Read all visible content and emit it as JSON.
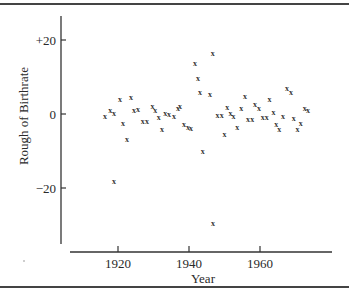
{
  "chart_data": {
    "type": "scatter",
    "title": "",
    "xlabel": "Year",
    "ylabel": "Rough of Birthrate",
    "marker": "x",
    "xlim": [
      1906,
      1980
    ],
    "ylim": [
      -35,
      27
    ],
    "grid": false,
    "legend": null,
    "x_ticks": [
      1920,
      1940,
      1960
    ],
    "x_tick_labels": [
      "1920",
      "1940",
      "1960"
    ],
    "y_ticks": [
      20,
      0,
      -20
    ],
    "y_tick_labels": [
      "+20",
      "0",
      "−20"
    ],
    "points": [
      {
        "x": 1916.3,
        "y": -0.5
      },
      {
        "x": 1917.8,
        "y": 1.0
      },
      {
        "x": 1918.9,
        "y": 0.3
      },
      {
        "x": 1918.9,
        "y": -18.0
      },
      {
        "x": 1920.6,
        "y": 4.0
      },
      {
        "x": 1921.4,
        "y": -2.5
      },
      {
        "x": 1922.5,
        "y": -6.8
      },
      {
        "x": 1923.7,
        "y": 4.5
      },
      {
        "x": 1924.5,
        "y": 1.2
      },
      {
        "x": 1925.6,
        "y": 1.4
      },
      {
        "x": 1927.0,
        "y": -2.0
      },
      {
        "x": 1928.2,
        "y": -2.0
      },
      {
        "x": 1929.7,
        "y": 2.2
      },
      {
        "x": 1930.5,
        "y": 1.1
      },
      {
        "x": 1931.5,
        "y": -0.8
      },
      {
        "x": 1932.4,
        "y": -4.0
      },
      {
        "x": 1933.3,
        "y": 0.3
      },
      {
        "x": 1934.4,
        "y": 0.0
      },
      {
        "x": 1935.8,
        "y": -0.5
      },
      {
        "x": 1936.9,
        "y": 1.6
      },
      {
        "x": 1937.5,
        "y": 2.2
      },
      {
        "x": 1938.6,
        "y": -2.7
      },
      {
        "x": 1939.7,
        "y": -3.5
      },
      {
        "x": 1940.6,
        "y": -3.8
      },
      {
        "x": 1941.7,
        "y": 13.8
      },
      {
        "x": 1942.5,
        "y": 9.7
      },
      {
        "x": 1943.1,
        "y": 5.9
      },
      {
        "x": 1943.9,
        "y": -10.0
      },
      {
        "x": 1945.9,
        "y": 5.4
      },
      {
        "x": 1946.7,
        "y": 16.5
      },
      {
        "x": 1946.8,
        "y": -29.5
      },
      {
        "x": 1948.0,
        "y": -0.2
      },
      {
        "x": 1949.2,
        "y": -0.2
      },
      {
        "x": 1950.0,
        "y": -5.4
      },
      {
        "x": 1950.8,
        "y": 1.9
      },
      {
        "x": 1951.7,
        "y": 0.2
      },
      {
        "x": 1952.5,
        "y": -0.5
      },
      {
        "x": 1953.6,
        "y": -3.5
      },
      {
        "x": 1954.7,
        "y": 1.6
      },
      {
        "x": 1955.8,
        "y": 4.9
      },
      {
        "x": 1956.6,
        "y": -1.4
      },
      {
        "x": 1957.8,
        "y": -1.4
      },
      {
        "x": 1958.6,
        "y": 2.7
      },
      {
        "x": 1959.7,
        "y": 1.6
      },
      {
        "x": 1960.8,
        "y": -0.8
      },
      {
        "x": 1961.9,
        "y": -0.8
      },
      {
        "x": 1962.7,
        "y": 4.1
      },
      {
        "x": 1963.8,
        "y": 0.5
      },
      {
        "x": 1964.6,
        "y": -2.7
      },
      {
        "x": 1965.4,
        "y": -4.1
      },
      {
        "x": 1966.5,
        "y": -0.5
      },
      {
        "x": 1967.6,
        "y": 7.0
      },
      {
        "x": 1968.7,
        "y": 5.9
      },
      {
        "x": 1969.5,
        "y": -1.1
      },
      {
        "x": 1970.6,
        "y": -4.1
      },
      {
        "x": 1971.5,
        "y": -2.4
      },
      {
        "x": 1972.6,
        "y": 1.6
      },
      {
        "x": 1973.5,
        "y": 1.0
      }
    ]
  },
  "axes": {
    "x_title": "Year",
    "y_title": "Rough of Birthrate",
    "x_tick_labels": [
      "1920",
      "1940",
      "1960"
    ],
    "y_tick_labels": [
      "+20",
      "0",
      "−20"
    ]
  },
  "marker_glyph": "x"
}
